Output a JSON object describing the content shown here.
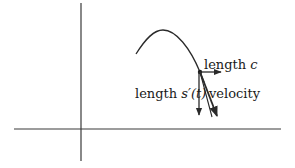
{
  "figure": {
    "labels": {
      "horizontal_component": "length",
      "horizontal_symbol": "c",
      "vertical_component": "length",
      "vertical_symbol": "s′(t)",
      "velocity": "velocity"
    },
    "colors": {
      "stroke": "#2a2a2a",
      "background": "#ffffff"
    }
  }
}
